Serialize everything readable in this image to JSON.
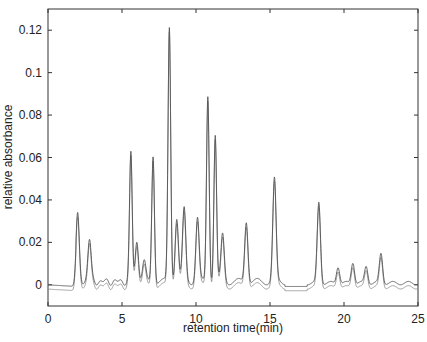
{
  "chart_data": {
    "type": "line",
    "title": "",
    "xlabel": "retention time(min)",
    "ylabel": "relative absorbance",
    "xlim": [
      0,
      25
    ],
    "ylim": [
      -0.01,
      0.13
    ],
    "xticks": [
      0,
      5,
      10,
      15,
      20,
      25
    ],
    "xtick_labels": [
      "0",
      "5",
      "10",
      "15",
      "20",
      "25"
    ],
    "yticks": [
      0,
      0.02,
      0.04,
      0.06,
      0.08,
      0.1,
      0.12
    ],
    "ytick_labels": [
      "0",
      "0.02",
      "0.04",
      "0.06",
      "0.08",
      "0.1",
      "0.12"
    ],
    "grid": false,
    "legend": null,
    "line_color": "#555555",
    "series": [
      {
        "name": "chromatogram 1",
        "peaks": [
          {
            "x": 2.0,
            "y": 0.031
          },
          {
            "x": 2.8,
            "y": 0.02
          },
          {
            "x": 5.6,
            "y": 0.061
          },
          {
            "x": 6.0,
            "y": 0.02
          },
          {
            "x": 6.5,
            "y": 0.009
          },
          {
            "x": 7.1,
            "y": 0.06
          },
          {
            "x": 8.2,
            "y": 0.12
          },
          {
            "x": 8.7,
            "y": 0.03
          },
          {
            "x": 9.2,
            "y": 0.034
          },
          {
            "x": 10.1,
            "y": 0.03
          },
          {
            "x": 10.8,
            "y": 0.088
          },
          {
            "x": 11.3,
            "y": 0.069
          },
          {
            "x": 11.8,
            "y": 0.022
          },
          {
            "x": 13.4,
            "y": 0.029
          },
          {
            "x": 15.3,
            "y": 0.048
          },
          {
            "x": 18.3,
            "y": 0.038
          },
          {
            "x": 19.6,
            "y": 0.008
          },
          {
            "x": 20.6,
            "y": 0.01
          },
          {
            "x": 21.5,
            "y": 0.008
          },
          {
            "x": 22.5,
            "y": 0.014
          }
        ]
      },
      {
        "name": "chromatogram 2",
        "baseline_offset": -0.002
      }
    ]
  }
}
